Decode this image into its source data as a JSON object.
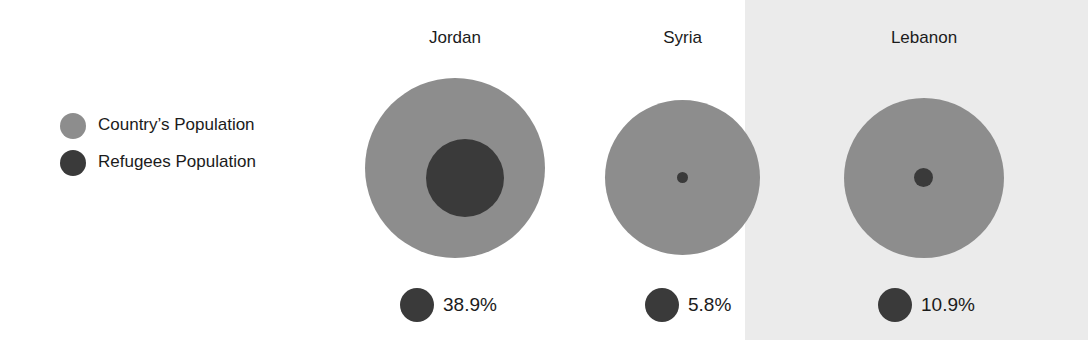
{
  "chart_data": {
    "type": "bubble",
    "title": "",
    "subtitle": "",
    "xlabel": "",
    "ylabel": "",
    "grid": false,
    "legend_position": "left",
    "categories": [
      "Jordan",
      "Syria",
      "Lebanon"
    ],
    "series": [
      {
        "name": "Country's Population",
        "color": "#8d8d8d",
        "encoding": "outer-circle-area"
      },
      {
        "name": "Refugees Population",
        "color": "#3a3a3a",
        "encoding": "inner-circle-area"
      }
    ],
    "points": [
      {
        "category": "Jordan",
        "refugee_share_label": "38.9%",
        "refugee_share_value": 38.9,
        "outer_diameter_px": 180,
        "inner_diameter_px": 78
      },
      {
        "category": "Syria",
        "refugee_share_label": "5.8%",
        "refugee_share_value": 5.8,
        "outer_diameter_px": 155,
        "inner_diameter_px": 11
      },
      {
        "category": "Lebanon",
        "refugee_share_label": "10.9%",
        "refugee_share_value": 10.9,
        "outer_diameter_px": 160,
        "inner_diameter_px": 19
      }
    ],
    "annotations": []
  },
  "legend": {
    "items": [
      {
        "label": "Country’s Population",
        "color": "#8d8d8d"
      },
      {
        "label": "Refugees Population",
        "color": "#3a3a3a"
      }
    ]
  },
  "countries": [
    {
      "name": "Jordan",
      "percent": "38.9%"
    },
    {
      "name": "Syria",
      "percent": "5.8%"
    },
    {
      "name": "Lebanon",
      "percent": "10.9%"
    }
  ],
  "colors": {
    "population": "#8d8d8d",
    "refugees": "#3a3a3a",
    "background": "#ffffff",
    "shaded_background": "#ebebeb",
    "text": "#1b1b1b"
  }
}
